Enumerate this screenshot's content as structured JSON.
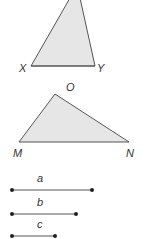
{
  "figure": {
    "triangle_xy": {
      "labels": {
        "X": "X",
        "Y": "Y"
      },
      "fill": "#e6e6e6",
      "stroke": "#555555"
    },
    "triangle_mon": {
      "labels": {
        "O": "O",
        "M": "M",
        "N": "N"
      },
      "fill": "#e6e6e6",
      "stroke": "#555555"
    },
    "segments": [
      {
        "label": "a"
      },
      {
        "label": "b"
      },
      {
        "label": "c"
      }
    ]
  }
}
